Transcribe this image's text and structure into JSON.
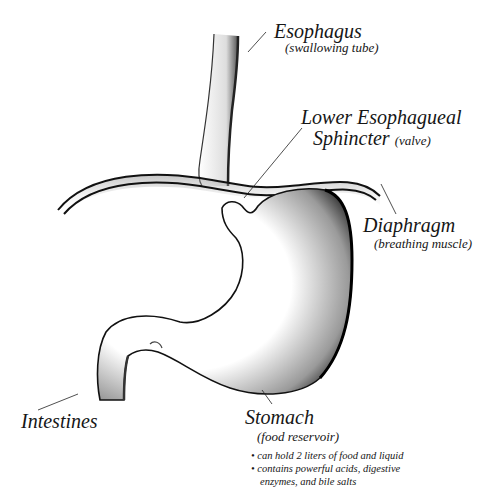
{
  "diagram": {
    "labels": {
      "esophagus": {
        "title": "Esophagus",
        "subtitle": "(swallowing tube)"
      },
      "les": {
        "title_line1": "Lower Esophagueal",
        "title_line2": "Sphincter",
        "subtitle": "(valve)"
      },
      "diaphragm": {
        "title": "Diaphragm",
        "subtitle": "(breathing muscle)"
      },
      "intestines": {
        "title": "Intestines"
      },
      "stomach": {
        "title": "Stomach",
        "subtitle": "(food reservoir)",
        "bullets": [
          "• can hold 2 liters of food and liquid",
          "• contains powerful acids, digestive",
          "enzymes, and bile salts"
        ]
      }
    },
    "colors": {
      "ink": "#111111",
      "background": "#ffffff",
      "shade": "#555555"
    }
  }
}
